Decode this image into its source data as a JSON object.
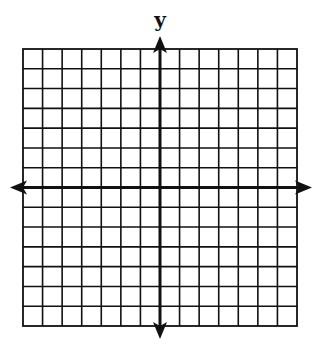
{
  "diagram": {
    "type": "coordinate-plane",
    "y_axis_label": "y",
    "x_axis_label": "",
    "grid": {
      "columns_left_of_y_axis": 7,
      "columns_right_of_y_axis": 7,
      "rows_above_x_axis": 7,
      "rows_below_x_axis": 7
    },
    "axes": {
      "x_axis_arrows": [
        "left",
        "right"
      ],
      "y_axis_arrows": [
        "up",
        "down"
      ]
    },
    "colors": {
      "line": "#111111",
      "background": "#ffffff"
    }
  }
}
